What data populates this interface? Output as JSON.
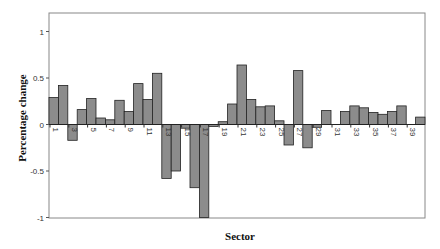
{
  "chart_data": {
    "type": "bar",
    "title": "",
    "xlabel": "Sector",
    "ylabel": "Percentage change",
    "ylim": [
      -1,
      1.2
    ],
    "yticks": [
      1,
      0.5,
      0,
      -0.5,
      -1
    ],
    "ytick_labels": [
      "1",
      "0.5",
      "0",
      "-0.5",
      "-1"
    ],
    "xtick_labels": [
      "1",
      "3",
      "5",
      "7",
      "9",
      "11",
      "13",
      "15",
      "17",
      "19",
      "21",
      "23",
      "25",
      "27",
      "29",
      "31",
      "33",
      "35",
      "37",
      "39"
    ],
    "grid": false,
    "legend": null,
    "categories": [
      "1",
      "2",
      "3",
      "4",
      "5",
      "6",
      "7",
      "8",
      "9",
      "10",
      "11",
      "12",
      "13",
      "14",
      "15",
      "16",
      "17",
      "18",
      "19",
      "20",
      "21",
      "22",
      "23",
      "24",
      "25",
      "26",
      "27",
      "28",
      "29",
      "30",
      "31",
      "32",
      "33",
      "34",
      "35",
      "36",
      "37",
      "38",
      "39",
      "40"
    ],
    "values": [
      0.29,
      0.42,
      -0.17,
      0.16,
      0.28,
      0.07,
      0.05,
      0.26,
      0.14,
      0.44,
      0.27,
      0.55,
      -0.58,
      -0.5,
      -0.04,
      -0.68,
      -1.0,
      -0.02,
      0.03,
      0.22,
      0.64,
      0.27,
      0.19,
      0.2,
      0.04,
      -0.22,
      0.58,
      -0.25,
      -0.03,
      0.15,
      0.0,
      0.14,
      0.2,
      0.18,
      0.13,
      0.11,
      0.14,
      0.2,
      0.0,
      0.08
    ],
    "bar_color": "#8c8c8c",
    "edge_color": "#222222"
  }
}
